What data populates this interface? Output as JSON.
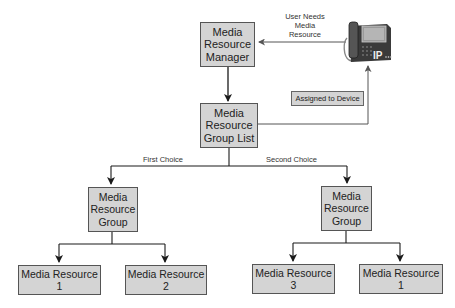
{
  "diagram": {
    "nodes": {
      "mrm": {
        "lines": [
          "Media",
          "Resource",
          "Manager"
        ]
      },
      "mrgl": {
        "lines": [
          "Media",
          "Resource",
          "Group List"
        ]
      },
      "mrg_left": {
        "lines": [
          "Media",
          "Resource",
          "Group"
        ]
      },
      "mrg_right": {
        "lines": [
          "Media",
          "Resource",
          "Group"
        ]
      },
      "mr_left_1": {
        "lines": [
          "Media Resource",
          "1"
        ]
      },
      "mr_left_2": {
        "lines": [
          "Media Resource",
          "2"
        ]
      },
      "mr_right_1": {
        "lines": [
          "Media Resource",
          "3"
        ]
      },
      "mr_right_2": {
        "lines": [
          "Media Resource",
          "1"
        ]
      },
      "phone": {
        "icon": "ip-phone-icon",
        "badge": "IP"
      }
    },
    "labels": {
      "user_needs": [
        "User Needs",
        "Media",
        "Resource"
      ],
      "assigned": "Assigned to Device",
      "first_choice": "First Choice",
      "second_choice": "Second Choice"
    },
    "edges": [
      {
        "from": "phone",
        "to": "mrm",
        "label": "User Needs Media Resource"
      },
      {
        "from": "mrm",
        "to": "mrgl"
      },
      {
        "from": "mrgl",
        "to": "phone",
        "label": "Assigned to Device"
      },
      {
        "from": "mrgl",
        "to": "mrg_left",
        "label": "First Choice"
      },
      {
        "from": "mrgl",
        "to": "mrg_right",
        "label": "Second Choice"
      },
      {
        "from": "mrg_left",
        "to": "mr_left_1"
      },
      {
        "from": "mrg_left",
        "to": "mr_left_2"
      },
      {
        "from": "mrg_right",
        "to": "mr_right_1"
      },
      {
        "from": "mrg_right",
        "to": "mr_right_2"
      }
    ],
    "colors": {
      "box_fill": "#d4d4d4",
      "box_border": "#555555",
      "line": "#222222",
      "gray_line": "#777777"
    }
  }
}
